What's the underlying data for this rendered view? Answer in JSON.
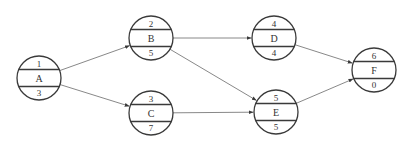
{
  "diagram": {
    "type": "activity-network",
    "nodes": [
      {
        "id": "A",
        "top": "1",
        "label": "A",
        "bottom": "3",
        "cx": 39,
        "cy": 78
      },
      {
        "id": "B",
        "top": "2",
        "label": "B",
        "bottom": "5",
        "cx": 151,
        "cy": 38
      },
      {
        "id": "C",
        "top": "3",
        "label": "C",
        "bottom": "7",
        "cx": 151,
        "cy": 113
      },
      {
        "id": "D",
        "top": "4",
        "label": "D",
        "bottom": "4",
        "cx": 274,
        "cy": 38
      },
      {
        "id": "E",
        "top": "5",
        "label": "E",
        "bottom": "5",
        "cx": 276,
        "cy": 112
      },
      {
        "id": "F",
        "top": "6",
        "label": "F",
        "bottom": "0",
        "cx": 374,
        "cy": 70
      }
    ],
    "edges": [
      {
        "from": "A",
        "to": "B"
      },
      {
        "from": "A",
        "to": "C"
      },
      {
        "from": "B",
        "to": "D"
      },
      {
        "from": "B",
        "to": "E"
      },
      {
        "from": "C",
        "to": "E"
      },
      {
        "from": "D",
        "to": "F"
      },
      {
        "from": "E",
        "to": "F"
      }
    ],
    "colors": {
      "stroke": "#3a3a3a",
      "edge": "#6a6a6a",
      "text": "#333333",
      "background": "#ffffff"
    }
  }
}
